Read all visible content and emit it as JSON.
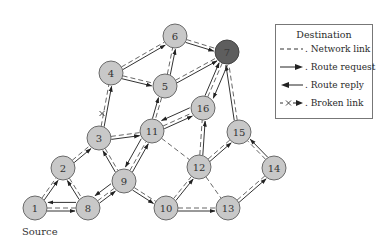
{
  "diagram": {
    "source_label": "Source",
    "destination_node": "7",
    "source_node": "1",
    "colors": {
      "node_fill": "#c8c8c8",
      "destination_fill": "#5e5e5e",
      "stroke": "#6a6a6a"
    },
    "nodes": [
      {
        "id": "1",
        "x": 35,
        "y": 208
      },
      {
        "id": "2",
        "x": 63,
        "y": 168
      },
      {
        "id": "3",
        "x": 99,
        "y": 138
      },
      {
        "id": "4",
        "x": 111,
        "y": 73
      },
      {
        "id": "5",
        "x": 165,
        "y": 86
      },
      {
        "id": "6",
        "x": 175,
        "y": 36
      },
      {
        "id": "7",
        "x": 227,
        "y": 52
      },
      {
        "id": "8",
        "x": 88,
        "y": 208
      },
      {
        "id": "9",
        "x": 124,
        "y": 181
      },
      {
        "id": "10",
        "x": 166,
        "y": 208
      },
      {
        "id": "11",
        "x": 152,
        "y": 131
      },
      {
        "id": "12",
        "x": 199,
        "y": 167
      },
      {
        "id": "13",
        "x": 228,
        "y": 208
      },
      {
        "id": "14",
        "x": 274,
        "y": 168
      },
      {
        "id": "15",
        "x": 239,
        "y": 132
      },
      {
        "id": "16",
        "x": 203,
        "y": 108
      }
    ],
    "network_links": [
      [
        "1",
        "2"
      ],
      [
        "1",
        "8"
      ],
      [
        "2",
        "3"
      ],
      [
        "2",
        "8"
      ],
      [
        "3",
        "4"
      ],
      [
        "3",
        "11"
      ],
      [
        "3",
        "9"
      ],
      [
        "4",
        "6"
      ],
      [
        "4",
        "5"
      ],
      [
        "5",
        "6"
      ],
      [
        "5",
        "7"
      ],
      [
        "5",
        "11"
      ],
      [
        "6",
        "7"
      ],
      [
        "8",
        "9"
      ],
      [
        "9",
        "11"
      ],
      [
        "9",
        "10"
      ],
      [
        "11",
        "16"
      ],
      [
        "11",
        "12"
      ],
      [
        "10",
        "12"
      ],
      [
        "10",
        "13"
      ],
      [
        "12",
        "16"
      ],
      [
        "12",
        "15"
      ],
      [
        "12",
        "13"
      ],
      [
        "13",
        "14"
      ],
      [
        "14",
        "15"
      ],
      [
        "15",
        "7"
      ],
      [
        "16",
        "7"
      ]
    ],
    "route_requests": [
      [
        "1",
        "2"
      ],
      [
        "1",
        "8"
      ],
      [
        "2",
        "3"
      ],
      [
        "8",
        "9"
      ],
      [
        "3",
        "11"
      ],
      [
        "3",
        "4"
      ],
      [
        "4",
        "6"
      ],
      [
        "4",
        "5"
      ],
      [
        "5",
        "6"
      ],
      [
        "5",
        "7"
      ],
      [
        "6",
        "7"
      ],
      [
        "11",
        "5"
      ],
      [
        "9",
        "11"
      ],
      [
        "9",
        "10"
      ],
      [
        "11",
        "16"
      ],
      [
        "16",
        "7"
      ],
      [
        "10",
        "12"
      ],
      [
        "10",
        "13"
      ],
      [
        "12",
        "16"
      ],
      [
        "12",
        "15"
      ],
      [
        "13",
        "14"
      ],
      [
        "14",
        "15"
      ],
      [
        "15",
        "7"
      ],
      [
        "8",
        "2"
      ],
      [
        "9",
        "3"
      ]
    ],
    "route_replies": [
      [
        "7",
        "16"
      ],
      [
        "16",
        "11"
      ],
      [
        "11",
        "9"
      ],
      [
        "9",
        "8"
      ],
      [
        "8",
        "1"
      ]
    ],
    "broken_links": [
      [
        "3",
        "4"
      ]
    ]
  },
  "legend": {
    "title": "Destination",
    "items": [
      {
        "symbol": "network-link",
        "label": ". Network link"
      },
      {
        "symbol": "route-request",
        "label": ". Route request"
      },
      {
        "symbol": "route-reply",
        "label": ". Route reply"
      },
      {
        "symbol": "broken-link",
        "label": ". Broken link"
      }
    ]
  }
}
